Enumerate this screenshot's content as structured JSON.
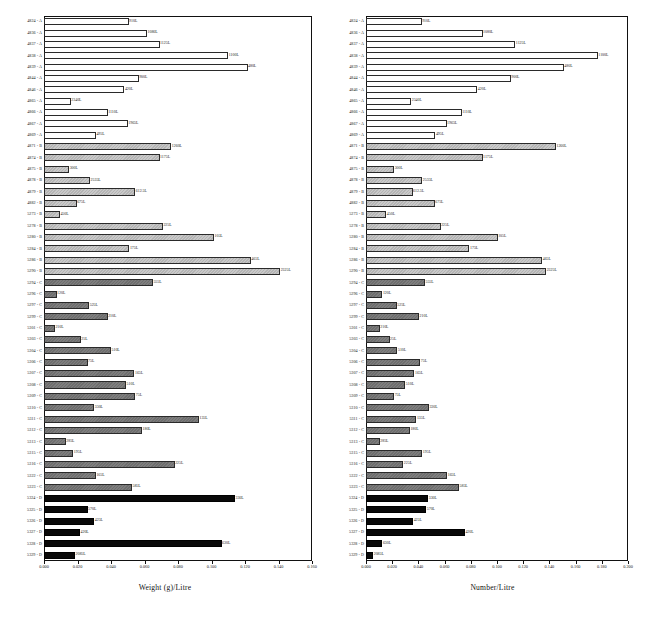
{
  "figure": {
    "panels": [
      {
        "id": "left",
        "axis_title": "Weight (g)/Litre",
        "xlim": [
          0.0,
          0.16
        ],
        "xticks": [
          "0.000",
          "0.020",
          "0.040",
          "0.060",
          "0.080",
          "0.100",
          "0.120",
          "0.140",
          "0.160"
        ]
      },
      {
        "id": "right",
        "axis_title": "Number/Litre",
        "xlim": [
          0.0,
          0.2
        ],
        "xticks": [
          "0.000",
          "0.020",
          "0.040",
          "0.060",
          "0.080",
          "0.100",
          "0.120",
          "0.140",
          "0.160",
          "0.180",
          "0.200"
        ]
      }
    ]
  },
  "chart_data": [
    {
      "type": "bar",
      "orientation": "horizontal",
      "title": "",
      "xlabel": "Weight (g)/Litre",
      "ylabel": "",
      "xlim": [
        0.0,
        0.16
      ],
      "xticks": [
        0.0,
        0.02,
        0.04,
        0.06,
        0.08,
        0.1,
        0.12,
        0.14,
        0.16
      ],
      "grid": false,
      "legend": "none",
      "categories": [
        "4824 - A",
        "4836 - A",
        "4837 - A",
        "4838 - A",
        "4839 - A",
        "4844 - A",
        "4846 - A",
        "4865 - A",
        "4866 - A",
        "4867 - A",
        "4869 - A",
        "4871 - B",
        "4874 - B",
        "4875 - B",
        "4878 - B",
        "4879 - B",
        "4882 - B",
        "5273 - B",
        "5278 - B",
        "5280 - B",
        "5284 - B",
        "5286 - B",
        "5290 - B",
        "5294 - C",
        "5296 - C",
        "5297 - C",
        "5299 - C",
        "5301 - C",
        "5303 - C",
        "5304 - C",
        "5306 - C",
        "5307 - C",
        "5308 - C",
        "5309 - C",
        "5310 - C",
        "5311 - C",
        "5312 - C",
        "5313 - C",
        "5315 - C",
        "5316 - C",
        "5322 - C",
        "5323 - C",
        "5324 - D",
        "5325 - D",
        "5326 - D",
        "5327 - D",
        "5328 - D",
        "5329 - D"
      ],
      "groups": [
        "A",
        "A",
        "A",
        "A",
        "A",
        "A",
        "A",
        "A",
        "A",
        "A",
        "A",
        "B",
        "B",
        "B",
        "B",
        "B",
        "B",
        "B",
        "B",
        "B",
        "B",
        "B",
        "B",
        "C",
        "C",
        "C",
        "C",
        "C",
        "C",
        "C",
        "C",
        "C",
        "C",
        "C",
        "C",
        "C",
        "C",
        "C",
        "C",
        "C",
        "C",
        "C",
        "D",
        "D",
        "D",
        "D",
        "D",
        "D"
      ],
      "values": [
        0.0505,
        0.0615,
        0.069,
        0.11,
        0.1215,
        0.0565,
        0.048,
        0.016,
        0.038,
        0.05,
        0.031,
        0.076,
        0.069,
        0.015,
        0.0275,
        0.0545,
        0.0195,
        0.0095,
        0.071,
        0.1015,
        0.051,
        0.1235,
        0.141,
        0.065,
        0.0075,
        0.027,
        0.038,
        0.0065,
        0.022,
        0.04,
        0.026,
        0.054,
        0.049,
        0.0545,
        0.03,
        0.0925,
        0.0585,
        0.013,
        0.0175,
        0.078,
        0.031,
        0.0525,
        0.114,
        0.026,
        0.03,
        0.0215,
        0.106,
        0.0185
      ],
      "bar_labels": [
        "910L",
        "1080L",
        "1125L",
        "1100L",
        "480L",
        "900L",
        "420L",
        "2340L",
        "1110L",
        "1965L",
        "495L",
        "1260L",
        "1175L",
        "300L",
        "2535L",
        "612.5L",
        "675L",
        "450L",
        "225L",
        "105L",
        "175L",
        "465L",
        "2325L",
        "555L",
        "120L",
        "525L",
        "210L",
        "210L",
        "25L",
        "510L",
        "75L",
        "165L",
        "510L",
        "75L",
        "330L",
        "135L",
        "180L",
        "285L",
        "195L",
        "225L",
        "165L",
        "585L",
        "330L",
        "570L",
        "425L",
        "420L",
        "630L",
        "2085L"
      ]
    },
    {
      "type": "bar",
      "orientation": "horizontal",
      "title": "",
      "xlabel": "Number/Litre",
      "ylabel": "",
      "xlim": [
        0.0,
        0.2
      ],
      "xticks": [
        0.0,
        0.02,
        0.04,
        0.06,
        0.08,
        0.1,
        0.12,
        0.14,
        0.16,
        0.18,
        0.2
      ],
      "grid": false,
      "legend": "none",
      "categories": [
        "4824 - A",
        "4836 - A",
        "4837 - A",
        "4838 - A",
        "4839 - A",
        "4844 - A",
        "4846 - A",
        "4865 - A",
        "4866 - A",
        "4867 - A",
        "4869 - A",
        "4871 - B",
        "4874 - B",
        "4875 - B",
        "4878 - B",
        "4879 - B",
        "4882 - B",
        "5273 - B",
        "5278 - B",
        "5280 - B",
        "5284 - B",
        "5286 - B",
        "5290 - B",
        "5294 - C",
        "5296 - C",
        "5297 - C",
        "5299 - C",
        "5301 - C",
        "5303 - C",
        "5304 - C",
        "5306 - C",
        "5307 - C",
        "5308 - C",
        "5309 - C",
        "5310 - C",
        "5311 - C",
        "5312 - C",
        "5313 - C",
        "5315 - C",
        "5316 - C",
        "5322 - C",
        "5323 - C",
        "5324 - D",
        "5325 - D",
        "5326 - D",
        "5327 - D",
        "5328 - D",
        "5329 - D"
      ],
      "groups": [
        "A",
        "A",
        "A",
        "A",
        "A",
        "A",
        "A",
        "A",
        "A",
        "A",
        "A",
        "B",
        "B",
        "B",
        "B",
        "B",
        "B",
        "B",
        "B",
        "B",
        "B",
        "B",
        "B",
        "C",
        "C",
        "C",
        "C",
        "C",
        "C",
        "C",
        "C",
        "C",
        "C",
        "C",
        "C",
        "C",
        "C",
        "C",
        "C",
        "C",
        "C",
        "C",
        "D",
        "D",
        "D",
        "D",
        "D",
        "D"
      ],
      "values": [
        0.0425,
        0.089,
        0.114,
        0.177,
        0.151,
        0.1105,
        0.085,
        0.0345,
        0.073,
        0.0615,
        0.053,
        0.145,
        0.089,
        0.0215,
        0.043,
        0.0355,
        0.0525,
        0.0155,
        0.057,
        0.1005,
        0.079,
        0.1345,
        0.1375,
        0.045,
        0.0125,
        0.0235,
        0.0405,
        0.0105,
        0.018,
        0.024,
        0.0415,
        0.037,
        0.03,
        0.0215,
        0.048,
        0.0385,
        0.0335,
        0.0105,
        0.043,
        0.0285,
        0.062,
        0.071,
        0.0475,
        0.046,
        0.036,
        0.0755,
        0.0125,
        0.0055
      ],
      "bar_labels": [
        "910L",
        "1080L",
        "1125L",
        "1100L",
        "480L",
        "900L",
        "420L",
        "2340L",
        "1110L",
        "1965L",
        "495L",
        "1260L",
        "1175L",
        "300L",
        "2535L",
        "612.5L",
        "675L",
        "450L",
        "225L",
        "105L",
        "175L",
        "465L",
        "2325L",
        "555L",
        "120L",
        "525L",
        "210L",
        "210L",
        "25L",
        "510L",
        "75L",
        "165L",
        "510L",
        "75L",
        "330L",
        "135L",
        "180L",
        "285L",
        "195L",
        "225L",
        "165L",
        "585L",
        "330L",
        "570L",
        "425L",
        "420L",
        "630L",
        "2085L"
      ]
    }
  ],
  "colors": {
    "group_A": "#ffffff",
    "group_B": "#c0c0c0",
    "group_C": "#767676",
    "group_D": "#090909",
    "axis": "#111111",
    "text": "#222222"
  }
}
